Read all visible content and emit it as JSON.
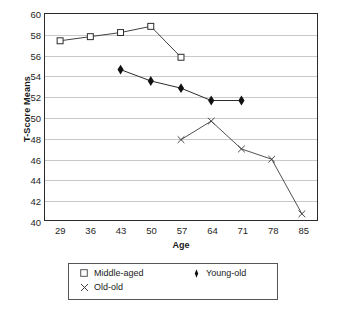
{
  "chart_data": {
    "type": "line",
    "title": "",
    "xlabel": "Age",
    "ylabel": "T-Score Means",
    "xlim": [
      25.5,
      88.5
    ],
    "ylim": [
      40,
      60
    ],
    "yticks": [
      40,
      42,
      44,
      46,
      48,
      50,
      52,
      54,
      56,
      58,
      60
    ],
    "xticks": [
      29,
      36,
      43,
      50,
      57,
      64,
      71,
      78,
      85
    ],
    "grid": "horizontal",
    "legend_position": "bottom",
    "series": [
      {
        "name": "Middle-aged",
        "marker": "open-square",
        "color": "#2b2b2b",
        "x": [
          29,
          36,
          43,
          50,
          57
        ],
        "values": [
          57.4,
          57.8,
          58.2,
          58.8,
          55.8
        ]
      },
      {
        "name": "Young-old",
        "marker": "filled-diamond",
        "color": "#111111",
        "x": [
          43,
          50,
          57,
          64,
          71
        ],
        "values": [
          54.6,
          53.5,
          52.8,
          51.6,
          51.6
        ]
      },
      {
        "name": "Old-old",
        "marker": "cross-x",
        "color": "#3a3a3a",
        "x": [
          57,
          64,
          71,
          78,
          85
        ],
        "values": [
          47.8,
          49.6,
          46.9,
          45.9,
          40.6
        ]
      }
    ]
  },
  "legend": {
    "entries": [
      {
        "label": "Middle-aged",
        "marker": "open-square"
      },
      {
        "label": "Young-old",
        "marker": "filled-diamond"
      },
      {
        "label": "Old-old",
        "marker": "cross-x"
      }
    ]
  }
}
